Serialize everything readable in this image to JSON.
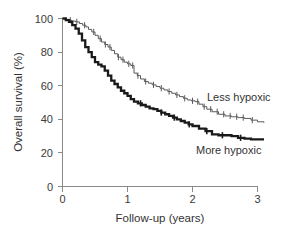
{
  "chart_data": {
    "type": "line",
    "title": "",
    "subtitle": "",
    "xlabel": "Follow-up (years)",
    "ylabel": "Overall survival (%)",
    "xlim": [
      0,
      3.1
    ],
    "ylim": [
      0,
      100
    ],
    "xticks": [
      0,
      1,
      2,
      3
    ],
    "xticklabels": [
      "0",
      "1",
      "2",
      "3"
    ],
    "yticks": [
      0,
      20,
      40,
      60,
      80,
      100
    ],
    "yticklabels": [
      "0",
      "20",
      "40",
      "60",
      "80",
      "100"
    ],
    "grid": false,
    "legend_position": "inline-annotation",
    "series": [
      {
        "name": "Less hypoxic",
        "label": "Less hypoxic",
        "color": "#5a5a5a",
        "line_width": 1.0,
        "style": "kaplan-meier-step-thin",
        "annotation_x": 2.26,
        "annotation_y": 52,
        "x": [
          0.0,
          0.06,
          0.1,
          0.14,
          0.2,
          0.26,
          0.31,
          0.36,
          0.4,
          0.45,
          0.5,
          0.55,
          0.6,
          0.65,
          0.7,
          0.75,
          0.8,
          0.85,
          0.9,
          0.95,
          1.0,
          1.05,
          1.1,
          1.15,
          1.2,
          1.26,
          1.32,
          1.38,
          1.44,
          1.5,
          1.56,
          1.62,
          1.68,
          1.74,
          1.8,
          1.86,
          1.92,
          1.98,
          2.04,
          2.1,
          2.16,
          2.22,
          2.3,
          2.4,
          2.5,
          2.6,
          2.7,
          2.8,
          2.9,
          3.0,
          3.1
        ],
        "y": [
          100,
          99.5,
          99,
          98.5,
          98,
          97,
          96,
          95,
          93.5,
          92,
          90,
          88,
          86,
          84.5,
          83,
          81,
          79,
          77,
          75.5,
          74,
          73,
          72,
          67.5,
          66,
          64,
          62.5,
          61.5,
          60.5,
          59.5,
          58.5,
          57.5,
          56.5,
          55.5,
          54.5,
          53.5,
          52.5,
          51.5,
          51,
          50.5,
          49,
          47.5,
          46,
          44.5,
          43,
          42,
          41.5,
          41,
          40.5,
          39.5,
          38.5,
          38
        ],
        "censor_marks_x": [
          0.12,
          0.22,
          0.34,
          0.48,
          0.58,
          0.66,
          0.73,
          0.86,
          0.93,
          1.02,
          1.08,
          1.16,
          1.28,
          1.4,
          1.52,
          1.64,
          1.76,
          1.88,
          2.0,
          2.08,
          2.18,
          2.28,
          2.38,
          2.48,
          2.58,
          2.68,
          2.78,
          2.92
        ],
        "end_value": 38
      },
      {
        "name": "More hypoxic",
        "label": "More hypoxic",
        "color": "#1a1a1a",
        "line_width": 2.3,
        "style": "kaplan-meier-step-bold",
        "annotation_x": 2.04,
        "annotation_y": 20,
        "x": [
          0.0,
          0.05,
          0.1,
          0.15,
          0.2,
          0.25,
          0.3,
          0.35,
          0.4,
          0.45,
          0.5,
          0.55,
          0.6,
          0.65,
          0.7,
          0.75,
          0.8,
          0.85,
          0.9,
          0.95,
          1.0,
          1.05,
          1.1,
          1.16,
          1.22,
          1.28,
          1.34,
          1.4,
          1.46,
          1.52,
          1.58,
          1.64,
          1.7,
          1.76,
          1.82,
          1.88,
          1.94,
          2.0,
          2.1,
          2.2,
          2.3,
          2.4,
          2.5,
          2.6,
          2.7,
          2.8,
          2.9,
          3.0,
          3.1
        ],
        "y": [
          100,
          99,
          98,
          96,
          94,
          91,
          87,
          83,
          80,
          77,
          74,
          72.5,
          71.5,
          69,
          66,
          63,
          61,
          59,
          57,
          55.5,
          54,
          52,
          50.5,
          49.5,
          48.5,
          47.5,
          46.5,
          46,
          45,
          44,
          43,
          42,
          41,
          40,
          39,
          38,
          37,
          36,
          34.5,
          33,
          31,
          30.5,
          30.5,
          30,
          29,
          28.5,
          28,
          28,
          28
        ],
        "censor_marks_x": [
          1.2,
          1.52,
          1.72,
          1.95,
          2.22,
          2.46,
          2.74
        ],
        "end_value": 28
      }
    ]
  },
  "axis": {
    "y_title": "Overall survival (%)",
    "x_title": "Follow-up (years)"
  },
  "labels": {
    "less_hypoxic": "Less hypoxic",
    "more_hypoxic": "More hypoxic"
  },
  "ticks": {
    "x": [
      "0",
      "1",
      "2",
      "3"
    ],
    "y": [
      "0",
      "20",
      "40",
      "60",
      "80",
      "100"
    ]
  },
  "colors": {
    "less_hypoxic": "#5a5a5a",
    "more_hypoxic": "#1a1a1a",
    "axis": "#8a8a8a",
    "text": "#333333",
    "background": "#ffffff"
  }
}
